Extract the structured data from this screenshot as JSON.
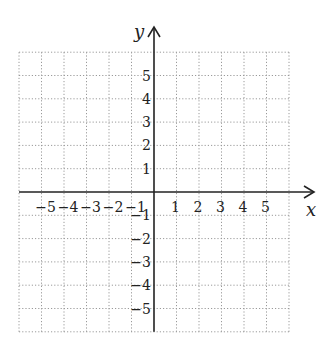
{
  "diagram": {
    "type": "cartesian-coordinate-grid",
    "x_axis": {
      "label": "x",
      "range": [
        -6,
        6
      ],
      "tick_labels": [
        "−5",
        "−4",
        "−3",
        "−2",
        "−1",
        "1",
        "2",
        "3",
        "4",
        "5"
      ],
      "tick_values": [
        -5,
        -4,
        -3,
        -2,
        -1,
        1,
        2,
        3,
        4,
        5
      ],
      "arrow": "positive"
    },
    "y_axis": {
      "label": "y",
      "range": [
        -6,
        6
      ],
      "tick_labels": [
        "5",
        "4",
        "3",
        "2",
        "1",
        "−1",
        "−2",
        "−3",
        "−4",
        "−5"
      ],
      "tick_values": [
        5,
        4,
        3,
        2,
        1,
        -1,
        -2,
        -3,
        -4,
        -5
      ],
      "arrow": "positive"
    },
    "grid": {
      "style": "dotted",
      "step": 1,
      "color": "#9a9a9a"
    },
    "axis_color": "#222222"
  }
}
